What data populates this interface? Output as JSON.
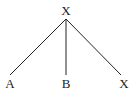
{
  "tree": {
    "root": {
      "label": "X"
    },
    "children": [
      {
        "label": "A"
      },
      {
        "label": "B"
      },
      {
        "label": "X"
      }
    ]
  },
  "colors": {
    "line": "#222222",
    "text": "#222222",
    "background": "#ffffff"
  }
}
